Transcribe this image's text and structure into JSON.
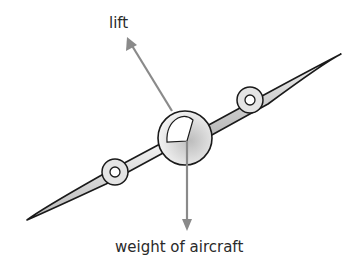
{
  "diagram": {
    "labels": {
      "lift": "lift",
      "weight": "weight of aircraft"
    },
    "colors": {
      "arrow": "#8a8a8a",
      "outline": "#1a1a1a",
      "wing_fill": "#d8d8d8",
      "text": "#2a2a2a"
    }
  }
}
